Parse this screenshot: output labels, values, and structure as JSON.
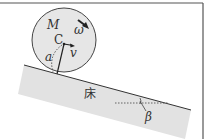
{
  "diagram": {
    "mass_label": "M",
    "center_label": "C",
    "angular_velocity_label": "ω",
    "velocity_label": "v",
    "radius_label": "a",
    "floor_label": "床",
    "incline_angle_label": "β",
    "colors": {
      "disk_fill": "#e6e6e6",
      "floor_fill": "#e2e2e2",
      "stroke": "#333333",
      "frame": "#555555"
    }
  }
}
